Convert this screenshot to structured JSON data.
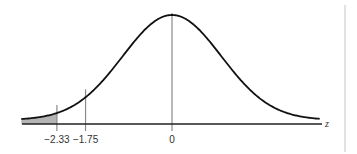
{
  "chart_data": {
    "type": "area",
    "title": "",
    "xlabel": "z",
    "ylabel": "",
    "distribution": "standard normal",
    "mean": 0,
    "sd": 1,
    "xlim": [
      -3.05,
      3.0
    ],
    "marked_values": [
      -2.33,
      -1.75,
      0
    ],
    "tick_labels": [
      "−2.33",
      "−1.75",
      "0"
    ],
    "shaded_region": {
      "from": "-inf",
      "to": -2.33,
      "color": "#b4b4b4"
    },
    "grid": false,
    "legend": null
  },
  "colors": {
    "curve": "#111111",
    "axis": "#222222",
    "marker_line": "#8a8a8a",
    "shade": "#b4b4b4",
    "divider": "#cfcfcf"
  },
  "labels": {
    "z_axis": "z",
    "tick_neg233": "−2.33",
    "tick_neg175": "−1.75",
    "tick_zero": "0"
  }
}
